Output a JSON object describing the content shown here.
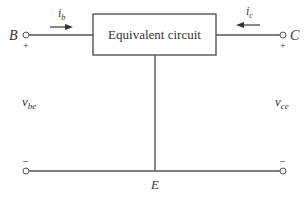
{
  "diagram": {
    "box": {
      "label": "Equivalent circuit"
    },
    "terminals": {
      "base": {
        "label": "B",
        "polarity_top": "+",
        "polarity_bottom": "–"
      },
      "collector": {
        "label": "C",
        "polarity_top": "+",
        "polarity_bottom": "–"
      },
      "emitter": {
        "label": "E"
      }
    },
    "currents": {
      "base": {
        "symbol": "i",
        "subscript": "b",
        "direction": "right"
      },
      "collector": {
        "symbol": "i",
        "subscript": "c",
        "direction": "left"
      }
    },
    "voltages": {
      "base_emitter": {
        "symbol": "v",
        "subscript": "be"
      },
      "collector_emitter": {
        "symbol": "v",
        "subscript": "ce"
      }
    },
    "colors": {
      "line": "#555555",
      "text": "#333333",
      "background": "#ffffff"
    }
  }
}
